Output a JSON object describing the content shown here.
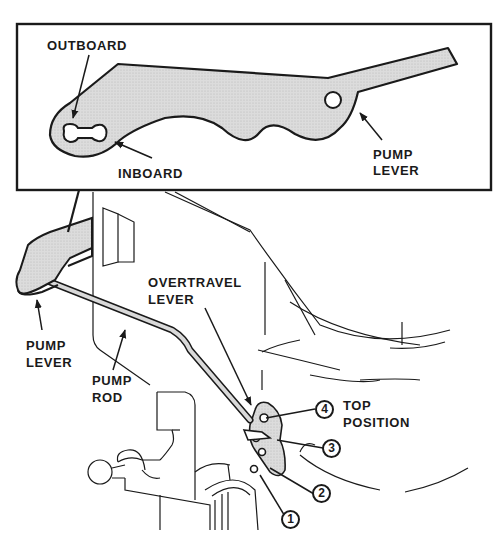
{
  "figure": {
    "colors": {
      "ink": "#1a1a1a",
      "part_fill": "#d9d9d9",
      "background": "#ffffff"
    }
  },
  "inset": {
    "labels": {
      "outboard": "OUTBOARD",
      "inboard": "INBOARD",
      "pump_lever_line1": "PUMP",
      "pump_lever_line2": "LEVER"
    }
  },
  "main": {
    "labels": {
      "overtravel_line1": "OVERTRAVEL",
      "overtravel_line2": "LEVER",
      "pump_lever_line1": "PUMP",
      "pump_lever_line2": "LEVER",
      "pump_rod_line1": "PUMP",
      "pump_rod_line2": "ROD",
      "top_position_line1": "TOP",
      "top_position_line2": "POSITION"
    },
    "positions": [
      {
        "number": "1"
      },
      {
        "number": "2"
      },
      {
        "number": "3"
      },
      {
        "number": "4"
      }
    ]
  }
}
